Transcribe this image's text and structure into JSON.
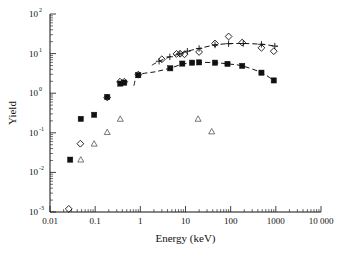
{
  "figure": {
    "background": "#ffffff",
    "ink_color": "#111111"
  },
  "chart_data": {
    "type": "scatter",
    "title": "",
    "xlabel": "Energy (keV)",
    "ylabel": "Yield",
    "xscale": "log",
    "yscale": "log",
    "xlim": [
      0.01,
      10000
    ],
    "ylim": [
      0.001,
      100
    ],
    "grid": false,
    "legend": "none",
    "xticks": [
      0.01,
      0.1,
      1,
      10,
      100,
      1000,
      10000
    ],
    "xtick_labels": [
      "0.01",
      "0.1",
      "1",
      "10",
      "100",
      "1000",
      "10 000"
    ],
    "yticks": [
      0.001,
      0.01,
      0.1,
      1,
      10,
      100
    ],
    "ytick_labels": [
      "10",
      "10",
      "10",
      "10",
      "10",
      "10"
    ],
    "ytick_exponents": [
      "-3",
      "-2",
      "-1",
      "0",
      "1",
      "2"
    ],
    "series": [
      {
        "name": "filled-squares",
        "marker": "filled-square",
        "points": [
          [
            0.028,
            0.021
          ],
          [
            0.048,
            0.225
          ],
          [
            0.095,
            0.285
          ],
          [
            0.185,
            0.8
          ],
          [
            0.36,
            1.75
          ],
          [
            0.44,
            1.85
          ],
          [
            0.9,
            2.85
          ],
          [
            4.6,
            4.25
          ],
          [
            8.5,
            5.6
          ],
          [
            14,
            5.9
          ],
          [
            20,
            6.0
          ],
          [
            45,
            5.9
          ],
          [
            85,
            5.5
          ],
          [
            180,
            4.9
          ],
          [
            480,
            3.3
          ],
          [
            900,
            2.1
          ]
        ]
      },
      {
        "name": "open-diamonds",
        "marker": "open-diamond",
        "points": [
          [
            0.026,
            0.0012
          ],
          [
            0.047,
            0.053
          ],
          [
            0.185,
            0.78
          ],
          [
            0.355,
            1.95
          ],
          [
            0.44,
            1.95
          ],
          [
            0.9,
            2.95
          ],
          [
            3.0,
            7.2
          ],
          [
            6.3,
            9.8
          ],
          [
            7.6,
            9.9
          ],
          [
            9.5,
            9.6
          ],
          [
            20,
            11.0
          ],
          [
            45,
            18.0
          ],
          [
            90,
            27.0
          ],
          [
            180,
            19.0
          ],
          [
            480,
            14.0
          ],
          [
            900,
            11.5
          ]
        ]
      },
      {
        "name": "open-triangles",
        "marker": "open-triangle",
        "points": [
          [
            0.048,
            0.021
          ],
          [
            0.095,
            0.053
          ],
          [
            0.185,
            0.104
          ],
          [
            0.36,
            0.225
          ],
          [
            19,
            0.225
          ],
          [
            38,
            0.108
          ]
        ]
      },
      {
        "name": "upper-fit-plus",
        "marker": "plus",
        "line": "dashed",
        "points": [
          [
            2.6,
            6.4
          ],
          [
            4.5,
            8.3
          ],
          [
            7.5,
            9.9
          ],
          [
            11,
            11.5
          ],
          [
            20,
            13.5
          ],
          [
            45,
            16.5
          ],
          [
            90,
            17.8
          ],
          [
            190,
            18.0
          ],
          [
            480,
            17.2
          ],
          [
            950,
            15.5
          ]
        ],
        "curve_start": [
          1.8,
          5.1
        ],
        "curve_end": [
          1100,
          15.0
        ]
      },
      {
        "name": "lower-fit-curve",
        "marker": "none",
        "line": "dashed",
        "points": [
          [
            0.9,
            2.85
          ],
          [
            2.2,
            3.5
          ],
          [
            4.6,
            4.3
          ],
          [
            8.5,
            5.4
          ],
          [
            14,
            5.85
          ],
          [
            20,
            6.0
          ],
          [
            45,
            5.9
          ],
          [
            85,
            5.5
          ],
          [
            180,
            4.9
          ],
          [
            480,
            3.3
          ],
          [
            900,
            2.1
          ]
        ],
        "curve_start": [
          0.72,
          1.55
        ],
        "curve_end": [
          1000,
          2.0
        ]
      }
    ]
  }
}
